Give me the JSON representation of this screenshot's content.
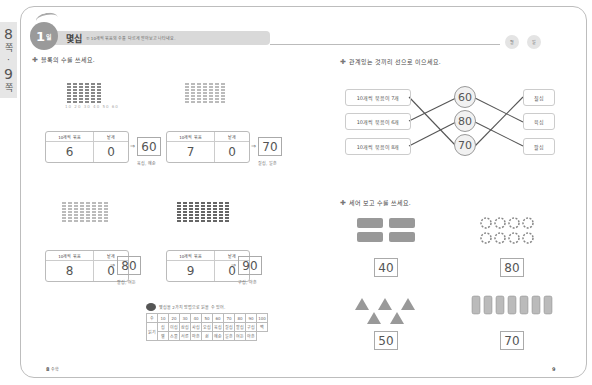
{
  "side_tab": {
    "top": "8",
    "top_sub": "쪽",
    "dot": "·",
    "bottom": "9",
    "bottom_sub": "쪽"
  },
  "header": {
    "day_num": "1",
    "day_suffix": "일",
    "title": "몇십",
    "subtitle": "① 10개씩 묶음의 수를 다르게 알아보고 나타내요.",
    "date_labels": [
      "월",
      "일"
    ]
  },
  "section1": {
    "instruction": "블록의 수를 쓰세요.",
    "tick_labels": "10 20 30 40 50 60",
    "col_headers": [
      "10개씩 묶음",
      "낱개"
    ],
    "problems": [
      {
        "tens": "6",
        "ones": "0",
        "answer": "60",
        "reading": "육십, 예순"
      },
      {
        "tens": "7",
        "ones": "0",
        "answer": "70",
        "reading": "칠십, 일흔"
      },
      {
        "tens": "8",
        "ones": "0",
        "answer": "80",
        "reading": "팔십, 여든"
      },
      {
        "tens": "9",
        "ones": "0",
        "answer": "90",
        "reading": "구십, 아흔"
      }
    ],
    "arrow": "⇒"
  },
  "note": {
    "title": "몇십을 2가지 방법으로 읽을 수 있어.",
    "row_header": "수",
    "read_header": "읽기",
    "numbers": [
      "10",
      "20",
      "30",
      "40",
      "50",
      "60",
      "70",
      "80",
      "90",
      "100"
    ],
    "read1": [
      "십",
      "이십",
      "삼십",
      "사십",
      "오십",
      "육십",
      "칠십",
      "팔십",
      "구십",
      "백"
    ],
    "read2": [
      "열",
      "스물",
      "서른",
      "마흔",
      "쉰",
      "예순",
      "일흔",
      "여든",
      "아흔",
      ""
    ]
  },
  "section2": {
    "instruction": "관계있는 것끼리 선으로 이으세요.",
    "left": [
      "10개씩 묶음이 7개",
      "10개씩 묶음이 6개",
      "10개씩 묶음이 8개"
    ],
    "middle": [
      "60",
      "80",
      "70"
    ],
    "right": [
      "칠십",
      "육십",
      "팔십"
    ]
  },
  "section3": {
    "instruction": "세어 보고 수를 쓰세요.",
    "answers": [
      "40",
      "80",
      "50",
      "70"
    ]
  },
  "footer": {
    "left_page": "8",
    "left_label": "수학",
    "right_page": "9"
  }
}
